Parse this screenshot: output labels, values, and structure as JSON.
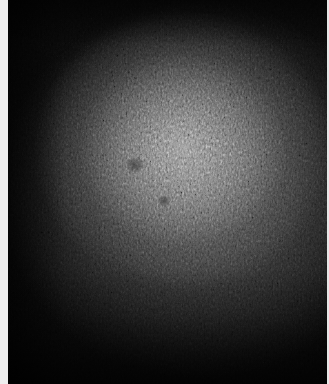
{
  "image": {
    "description": "Grainy grayscale texture with a diffuse bright glow in the upper-center, darkening toward the edges",
    "colors": {
      "background_dark": "#070707",
      "glow_center": "#969696",
      "glow_mid": "#5f5f5f",
      "left_border": "#eeeeee",
      "right_border": "#e6e6e6"
    }
  }
}
